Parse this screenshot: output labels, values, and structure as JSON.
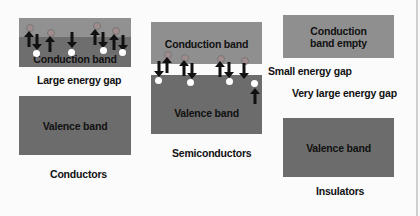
{
  "diagram": {
    "colors": {
      "conduction_band": "#8f8f8f",
      "valence_band": "#6c6c6c",
      "electron": "#a08c8c",
      "hole": "#ffffff",
      "background": "#fbfbfb"
    },
    "conductors": {
      "band_label": "Conduction band",
      "gap_label": "Large energy gap",
      "valence_label": "Valence band",
      "caption": "Conductors"
    },
    "semiconductors": {
      "conduction_label": "Conduction band",
      "gap_label": "Small energy gap",
      "valence_label": "Valence band",
      "caption": "Semiconductors"
    },
    "insulators": {
      "conduction_label": "Conduction band empty",
      "gap_label": "Very large energy gap",
      "valence_label": "Valence band",
      "caption": "Insulators"
    }
  }
}
